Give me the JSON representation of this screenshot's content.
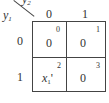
{
  "kmap": {
    "row_var": "y1",
    "col_var": "y2",
    "row_var_display": {
      "base": "y",
      "sub": "1"
    },
    "col_var_display": {
      "base": "y",
      "sub": "2"
    },
    "col_headers": [
      "0",
      "1"
    ],
    "row_headers": [
      "0",
      "1"
    ],
    "cells": [
      {
        "row": 0,
        "col": 0,
        "value": "0",
        "index": "0"
      },
      {
        "row": 0,
        "col": 1,
        "value": "0",
        "index": "1"
      },
      {
        "row": 1,
        "col": 0,
        "value": "x1'",
        "value_base": "x",
        "value_sub": "1",
        "value_suffix": "'",
        "index": "2"
      },
      {
        "row": 1,
        "col": 1,
        "value": "0",
        "index": "3"
      }
    ]
  }
}
